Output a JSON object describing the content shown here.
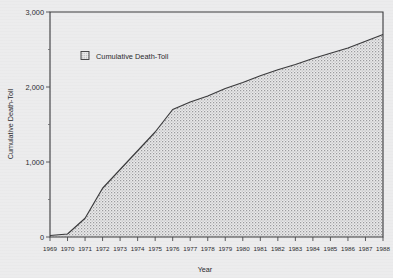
{
  "chart_data": {
    "type": "area",
    "title": "",
    "xlabel": "Year",
    "ylabel": "Cumulative Death-Toll",
    "legend": [
      {
        "label": "Cumulative Death-Toll",
        "swatch": "stippled-square"
      }
    ],
    "legend_position": "upper-left-inside",
    "grid": false,
    "xlim": [
      1969,
      1988
    ],
    "ylim": [
      0,
      3000
    ],
    "ytick_labels": [
      "0",
      "1,000",
      "2,000",
      "3,000"
    ],
    "ytick_values": [
      0,
      1000,
      2000,
      3000
    ],
    "ytick_minor_values": [
      500,
      1500,
      2500
    ],
    "xtick_labels": [
      "1969",
      "1970",
      "1971",
      "1972",
      "1973",
      "1974",
      "1975",
      "1976",
      "1977",
      "1978",
      "1979",
      "1980",
      "1981",
      "1982",
      "1983",
      "1984",
      "1985",
      "1986",
      "1987",
      "1988"
    ],
    "x": [
      1969,
      1970,
      1971,
      1972,
      1973,
      1974,
      1975,
      1976,
      1977,
      1978,
      1979,
      1980,
      1981,
      1982,
      1983,
      1984,
      1985,
      1986,
      1987,
      1988
    ],
    "values": [
      20,
      40,
      250,
      650,
      900,
      1150,
      1400,
      1700,
      1800,
      1880,
      1980,
      2060,
      2150,
      2230,
      2300,
      2380,
      2450,
      2520,
      2610,
      2700
    ],
    "series": [
      {
        "name": "Cumulative Death-Toll",
        "values": [
          20,
          40,
          250,
          650,
          900,
          1150,
          1400,
          1700,
          1800,
          1880,
          1980,
          2060,
          2150,
          2230,
          2300,
          2380,
          2450,
          2520,
          2610,
          2700
        ]
      }
    ],
    "colors": {
      "line": "#3a3a3c",
      "fill": "#d2d2d4",
      "background": "#ececed",
      "plot_background": "#ececed",
      "axis": "#3a3a3c",
      "text": "#2b2b2d"
    }
  }
}
